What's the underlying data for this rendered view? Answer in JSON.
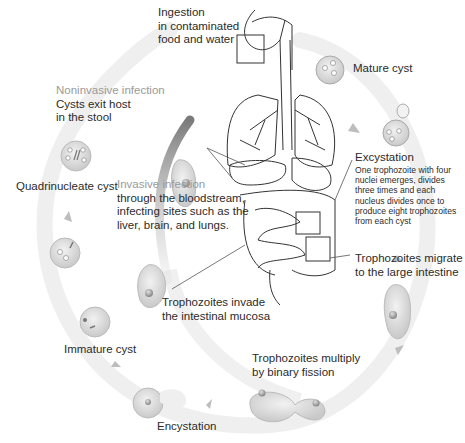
{
  "diagram": {
    "type": "life-cycle",
    "labels": {
      "ingestion": {
        "lines": [
          "Ingestion",
          "in contaminated",
          "food and water"
        ]
      },
      "mature_cyst": {
        "text": "Mature cyst"
      },
      "noninvasive": {
        "heading": "Noninvasive infection",
        "lines": [
          "Cysts exit host",
          "in the stool"
        ]
      },
      "quadrinucleate_cyst": {
        "text": "Quadrinucleate cyst"
      },
      "invasive": {
        "heading": "Invasive infection",
        "lines": [
          "through the bloodstream,",
          "infecting sites such as the",
          "liver, brain, and lungs."
        ]
      },
      "excystation": {
        "heading": "Excystation",
        "lines": [
          "One trophozoite with four",
          "nuclei emerges, divides",
          "three times and each",
          "nucleus divides once to",
          "produce eight trophozoites",
          "from each cyst"
        ]
      },
      "migrate": {
        "lines": [
          "Trophozoites migrate",
          "to the large intestine"
        ]
      },
      "invade": {
        "lines": [
          "Trophozoites invade",
          "the intestinal mucosa"
        ]
      },
      "immature_cyst": {
        "text": "Immature cyst"
      },
      "multiply": {
        "lines": [
          "Trophozoites multiply",
          "by binary fission"
        ]
      },
      "encystation": {
        "text": "Encystation"
      }
    },
    "colors": {
      "cycle_band": "#ececec",
      "cell_fill": "#d8d8d8",
      "invasive_band": "#6f6f6f",
      "outline": "#333333",
      "heading_grey": "#9a9a9a",
      "text": "#2b2b2b"
    }
  }
}
